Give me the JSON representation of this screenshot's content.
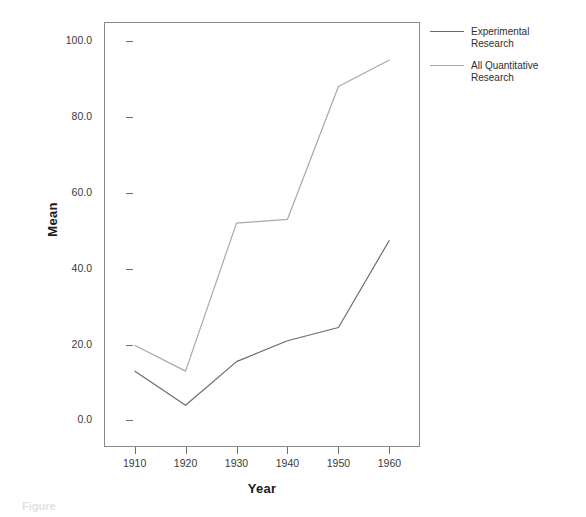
{
  "chart_data": {
    "type": "line",
    "title": "",
    "xlabel": "Year",
    "ylabel": "Mean",
    "x": [
      1910,
      1920,
      1930,
      1940,
      1950,
      1960
    ],
    "xtick_labels": [
      "1910",
      "1920",
      "1930",
      "1940",
      "1950",
      "1960"
    ],
    "ytick_labels": [
      "0.0",
      "20.0",
      "40.0",
      "60.0",
      "80.0",
      "100.0"
    ],
    "ytick_values": [
      0,
      20,
      40,
      60,
      80,
      100
    ],
    "ylim": [
      -7,
      105
    ],
    "xlim": [
      1904,
      1966
    ],
    "grid": false,
    "legend_position": "right-top",
    "series": [
      {
        "name": "Experimental Research",
        "color": "#6b6b6b",
        "values": [
          13.0,
          4.0,
          15.5,
          21.0,
          24.5,
          47.5
        ]
      },
      {
        "name": "All Quantitative Research",
        "color": "#a8a8a8",
        "values": [
          19.8,
          13.0,
          52.0,
          53.0,
          88.0,
          95.0
        ]
      }
    ]
  },
  "axes": {
    "y_title": "Mean",
    "x_title": "Year"
  },
  "legend": {
    "entries": [
      {
        "label_line1": "Experimental",
        "label_line2": "Research",
        "color": "#6b6b6b"
      },
      {
        "label_line1": "All Quantitative",
        "label_line2": "Research",
        "color": "#a8a8a8"
      }
    ]
  },
  "caption": {
    "text": "Figure"
  }
}
